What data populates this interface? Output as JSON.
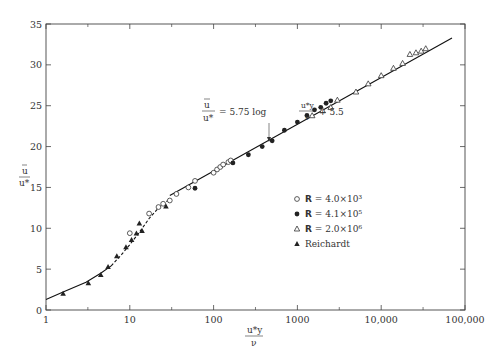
{
  "chart_data": {
    "type": "scatter",
    "title": "",
    "xlabel": "u*y / ν",
    "ylabel": "ū / u*",
    "xscale": "log",
    "xlim": [
      1,
      100000
    ],
    "ylim": [
      0,
      35
    ],
    "x_ticks": [
      "1",
      "10",
      "100",
      "1000",
      "10,000",
      "100,000"
    ],
    "y_ticks": [
      "0",
      "5",
      "10",
      "15",
      "20",
      "25",
      "30",
      "35"
    ],
    "grid": false,
    "legend_position": "lower right (inside)",
    "annotation": {
      "text": "ū/u* = 5.75 log(u*y/ν) + 5.5",
      "lhs_num": "u",
      "lhs_den": "u*",
      "middle": "= 5.75 log",
      "frac_num": "u*y",
      "frac_den": "ν",
      "tail": "+ 5.5",
      "arrow_target": [
        450,
        20.6
      ]
    },
    "lines": [
      {
        "name": "log law",
        "style": "solid",
        "x": [
          30,
          70000
        ],
        "y": [
          14.0,
          33.3
        ]
      },
      {
        "name": "viscous/buffer fit",
        "style": "solid",
        "x": [
          1,
          1.6,
          3,
          4.5,
          6
        ],
        "y": [
          1.3,
          2.2,
          3.4,
          4.5,
          5.4
        ]
      },
      {
        "name": "buffer fit",
        "style": "dashed",
        "x": [
          6,
          8,
          10,
          13,
          17,
          22,
          30
        ],
        "y": [
          5.4,
          6.8,
          8.0,
          9.5,
          11.2,
          12.5,
          13.6
        ]
      }
    ],
    "series": [
      {
        "name": "R = 4.0×10³",
        "marker": "open-circle",
        "x": [
          10,
          17,
          22,
          25,
          30,
          36,
          50,
          60,
          100,
          110,
          120,
          130,
          150,
          160
        ],
        "y": [
          9.4,
          11.8,
          12.6,
          13.0,
          13.4,
          14.2,
          15.0,
          15.8,
          16.8,
          17.2,
          17.5,
          17.8,
          18.1,
          18.3
        ]
      },
      {
        "name": "R = 4.1×10⁵",
        "marker": "filled-circle",
        "x": [
          60,
          170,
          260,
          380,
          500,
          700,
          1000,
          1300,
          1600,
          1900,
          2200,
          2500
        ],
        "y": [
          14.9,
          18.0,
          19.0,
          20.0,
          20.7,
          22.0,
          23.0,
          23.8,
          24.5,
          24.8,
          25.3,
          25.6
        ]
      },
      {
        "name": "R = 2.0×10⁶",
        "marker": "open-triangle",
        "x": [
          1500,
          2000,
          2500,
          3000,
          5000,
          7000,
          10000,
          14000,
          18000,
          22000,
          26000,
          30000,
          34000
        ],
        "y": [
          23.8,
          24.4,
          24.8,
          25.7,
          26.7,
          27.7,
          28.7,
          29.6,
          30.2,
          31.3,
          31.5,
          31.7,
          32.0
        ]
      },
      {
        "name": "Reichardt",
        "marker": "filled-triangle",
        "x": [
          1.6,
          3.2,
          4.5,
          5.5,
          7,
          9,
          10.5,
          12,
          13,
          14,
          27
        ],
        "y": [
          2.0,
          3.3,
          4.3,
          5.3,
          6.6,
          7.7,
          8.6,
          9.4,
          10.6,
          9.7,
          12.7
        ]
      }
    ],
    "legend": [
      {
        "symbol": "○",
        "bold": "R",
        "text": " = 4.0×10³"
      },
      {
        "symbol": "●",
        "bold": "R",
        "text": " = 4.1×10⁵"
      },
      {
        "symbol": "△",
        "bold": "R",
        "text": " = 2.0×10⁶"
      },
      {
        "symbol": "▲",
        "bold": "",
        "text": "Reichardt"
      }
    ]
  }
}
